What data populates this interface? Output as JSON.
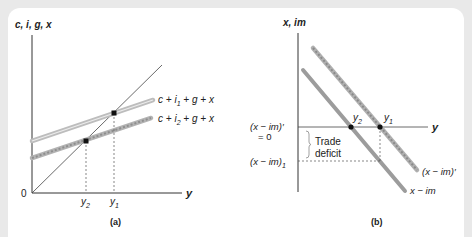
{
  "panel_a": {
    "y_axis_label": "c, i, g, x",
    "x_axis_label": "y",
    "origin_label": "0",
    "line_upper_label": {
      "c": "c + i",
      "sub": "1",
      "rest": " + g + x"
    },
    "line_lower_label": {
      "c": "c + i",
      "sub": "2",
      "rest": " + g + x"
    },
    "tick_y2": {
      "base": "y",
      "sub": "2"
    },
    "tick_y1": {
      "base": "y",
      "sub": "1"
    },
    "caption": "(a)"
  },
  "panel_b": {
    "y_axis_label": "x, im",
    "x_axis_label": "y",
    "zero_label_line1": "(x − im)′",
    "zero_label_line2": "= 0",
    "deficit_level_label": {
      "base": "(x − im)",
      "sub": "1"
    },
    "brace_label_line1": "Trade",
    "brace_label_line2": "deficit",
    "point_y2": {
      "base": "y",
      "sub": "2"
    },
    "point_y1": {
      "base": "y",
      "sub": "1"
    },
    "line_shifted_label": "(x − im)′",
    "line_original_label": "x − im",
    "caption": "(b)"
  },
  "colors": {
    "background": "#e9e9e9",
    "panel": "#ffffff",
    "axis": "#333333",
    "line_upper": "#bdbdbd",
    "line_beaded": "#a8a8a8",
    "line_solid_b": "#9a9a9a"
  }
}
